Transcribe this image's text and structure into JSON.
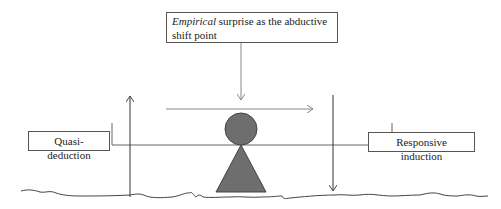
{
  "diagram": {
    "top_box": {
      "italic_word": "Empirical",
      "rest_text": " surprise as the abductive shift point"
    },
    "left_box": {
      "label": "Quasi-deduction"
    },
    "right_box": {
      "label": "Responsive induction"
    },
    "colors": {
      "figure_fill": "#6e6e6e",
      "figure_stroke": "#444444",
      "line": "#555555",
      "arrow_light": "#888888",
      "box_border": "#555555",
      "text": "#222222"
    },
    "elements": {
      "circle": "balance-head-circle",
      "triangle": "fulcrum-triangle",
      "beam": "balance-beam",
      "ground": "wavy-ground-line",
      "arrows": [
        "surprise-down-arrow",
        "shift-right-arrow",
        "deduction-up-arrow",
        "induction-down-arrow"
      ]
    }
  }
}
